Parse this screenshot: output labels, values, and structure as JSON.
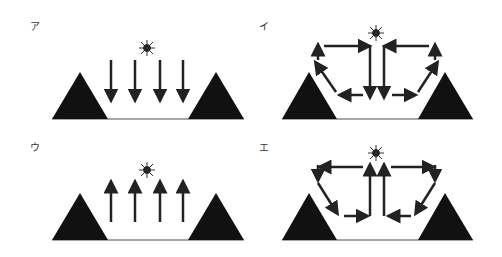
{
  "panels": [
    {
      "label": "ア",
      "pattern": "uniform-downward",
      "description": "Sun above; four parallel downward arrows into valley between two mountains"
    },
    {
      "label": "イ",
      "pattern": "circulation-down-center",
      "description": "Sun above; air descends in valley center, flows outward along floor, rises up mountain slopes, returns inward aloft"
    },
    {
      "label": "ウ",
      "pattern": "uniform-upward",
      "description": "Sun above; four parallel upward arrows out of valley between two mountains"
    },
    {
      "label": "エ",
      "pattern": "circulation-up-center",
      "description": "Sun above; air rises in valley center, flows outward aloft, descends down mountain slopes, returns inward along floor"
    }
  ],
  "colors": {
    "mountain": "#111111",
    "arrow": "#222222",
    "ground": "#888888",
    "sun": "#111111"
  },
  "icons": {
    "sun": "sun-icon",
    "mountain": "mountain-icon",
    "arrow": "arrow-icon"
  }
}
